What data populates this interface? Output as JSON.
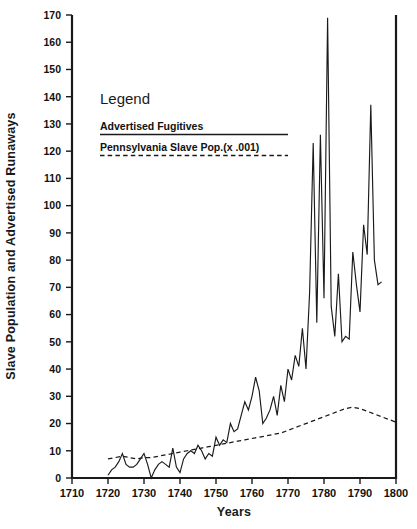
{
  "chart_data": {
    "type": "line",
    "title": "",
    "xlabel": "Years",
    "ylabel": "Slave Population and Advertised Runaways",
    "xlim": [
      1710,
      1800
    ],
    "ylim": [
      0,
      170
    ],
    "grid": false,
    "legend_position": "upper-left-inside",
    "legend_title": "Legend",
    "x_ticks": [
      1710,
      1720,
      1730,
      1740,
      1750,
      1760,
      1770,
      1780,
      1790,
      1800
    ],
    "y_ticks": [
      0,
      10,
      20,
      30,
      40,
      50,
      60,
      70,
      80,
      90,
      100,
      110,
      120,
      130,
      140,
      150,
      160,
      170
    ],
    "series": [
      {
        "name": "Advertised Fugitives",
        "style": "solid",
        "x": [
          1720,
          1721,
          1722,
          1723,
          1724,
          1725,
          1726,
          1727,
          1728,
          1729,
          1730,
          1731,
          1732,
          1733,
          1734,
          1735,
          1736,
          1737,
          1738,
          1739,
          1740,
          1741,
          1742,
          1743,
          1744,
          1745,
          1746,
          1747,
          1748,
          1749,
          1750,
          1751,
          1752,
          1753,
          1754,
          1755,
          1756,
          1757,
          1758,
          1759,
          1760,
          1761,
          1762,
          1763,
          1764,
          1765,
          1766,
          1767,
          1768,
          1769,
          1770,
          1771,
          1772,
          1773,
          1774,
          1775,
          1776,
          1777,
          1778,
          1779,
          1780,
          1781,
          1782,
          1783,
          1784,
          1785,
          1786,
          1787,
          1788,
          1789,
          1790,
          1791,
          1792,
          1793,
          1794,
          1795,
          1796
        ],
        "y": [
          1,
          3,
          4,
          6,
          9,
          5,
          4,
          4,
          5,
          7,
          9,
          5,
          0,
          3,
          5,
          6,
          5,
          4,
          11,
          4,
          2,
          7,
          9,
          10,
          9,
          12,
          10,
          7,
          9,
          8,
          15,
          12,
          14,
          13,
          20,
          17,
          18,
          23,
          28,
          25,
          30,
          37,
          32,
          20,
          22,
          25,
          30,
          23,
          34,
          28,
          40,
          36,
          45,
          41,
          55,
          40,
          68,
          123,
          57,
          126,
          66,
          169,
          63,
          52,
          75,
          50,
          52,
          51,
          83,
          71,
          61,
          93,
          82,
          137,
          80,
          71,
          72
        ]
      },
      {
        "name": "Pennsylvania Slave Pop.(x .001)",
        "style": "dashed",
        "x": [
          1720,
          1722,
          1724,
          1726,
          1728,
          1730,
          1732,
          1734,
          1736,
          1738,
          1740,
          1742,
          1744,
          1746,
          1748,
          1750,
          1752,
          1754,
          1756,
          1758,
          1760,
          1762,
          1764,
          1766,
          1768,
          1770,
          1772,
          1774,
          1776,
          1778,
          1780,
          1782,
          1784,
          1786,
          1788,
          1790,
          1792,
          1794,
          1796,
          1798,
          1800
        ],
        "y": [
          7,
          7.5,
          8,
          7.5,
          7,
          7.5,
          7.5,
          8,
          8.5,
          9,
          9.5,
          10,
          10.5,
          11,
          11.5,
          12,
          12.5,
          13,
          13.5,
          14,
          14.5,
          15,
          15.5,
          16,
          16.5,
          17.5,
          18.5,
          19.5,
          20.5,
          21.5,
          22.5,
          23.5,
          24.5,
          25.5,
          26,
          25.5,
          24.5,
          23.5,
          22.5,
          21.5,
          20.5
        ]
      }
    ]
  },
  "legend": {
    "title": "Legend",
    "items": [
      {
        "label": "Advertised Fugitives",
        "style": "solid"
      },
      {
        "label": "Pennsylvania Slave Pop.(x .001)",
        "style": "dashed"
      }
    ]
  },
  "axes": {
    "x_title": "Years",
    "y_title": "Slave Population and Advertised Runaways"
  }
}
